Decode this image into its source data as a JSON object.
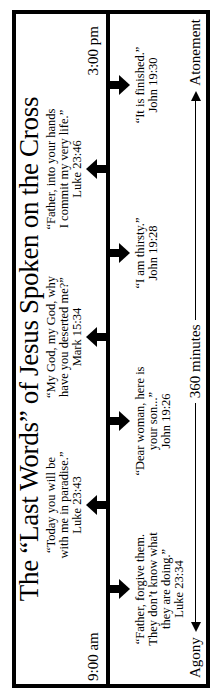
{
  "title": "The “Last Words” of Jesus Spoken on the Cross",
  "timeline": {
    "start_time": "9:00 am",
    "end_time": "3:00 pm"
  },
  "events": [
    {
      "side": "below",
      "lines": [
        "“Father, forgive them.",
        "They don’t know what",
        "they are doing.”"
      ],
      "reference": "Luke 23:34"
    },
    {
      "side": "above",
      "lines": [
        "“Today you will be",
        "with me in paradise.”"
      ],
      "reference": "Luke 23:43"
    },
    {
      "side": "below",
      "lines": [
        "“Dear woman, here is",
        "your son...”"
      ],
      "reference": "John 19:26"
    },
    {
      "side": "above",
      "lines": [
        "“My God, my God, why",
        "have you deserted me?”"
      ],
      "reference": "Mark 15:34"
    },
    {
      "side": "below",
      "lines": [
        "“I am thirsty.”"
      ],
      "reference": "John 19:28"
    },
    {
      "side": "above",
      "lines": [
        "“Father, into your hands",
        "I commit my very life.”"
      ],
      "reference": "Luke 23:46"
    },
    {
      "side": "below",
      "lines": [
        "“It is finished.”"
      ],
      "reference": "John 19:30"
    }
  ],
  "axis": {
    "left_label": "Agony",
    "center_label": "360 minutes",
    "right_label": "Atonement"
  },
  "colors": {
    "ink": "#000000",
    "paper": "#ffffff"
  }
}
